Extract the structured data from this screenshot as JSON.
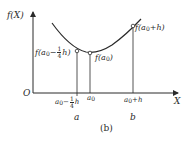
{
  "diagram": {
    "panel_label": "(b)",
    "axes": {
      "y_label": "f(X)",
      "x_label": "X",
      "origin_label": "O"
    },
    "points": [
      {
        "id": "left",
        "x_label_base": "a",
        "x_label_sub": "0",
        "x_label_op": "−",
        "x_label_frac_num": "1",
        "x_label_frac_den": "4",
        "x_label_tail": "h",
        "x_name": "a",
        "f_label_prefix": "f(",
        "f_label_base": "a",
        "f_label_sub": "0",
        "f_label_op": "−",
        "f_label_frac_num": "1",
        "f_label_frac_den": "4",
        "f_label_tail": "h)"
      },
      {
        "id": "mid",
        "x_label_base": "a",
        "x_label_sub": "0",
        "f_label_prefix": "f(",
        "f_label_base": "a",
        "f_label_sub": "0",
        "f_label_tail": ")"
      },
      {
        "id": "right",
        "x_label_base": "a",
        "x_label_sub": "0",
        "x_label_tail": "+h",
        "x_name": "b",
        "f_label_prefix": "f(",
        "f_label_base": "a",
        "f_label_sub": "0",
        "f_label_tail": "+h)"
      }
    ],
    "colors": {
      "stroke": "#2a2a2a",
      "background": "#ffffff"
    }
  }
}
